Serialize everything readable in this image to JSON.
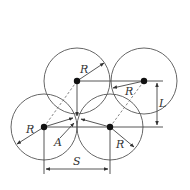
{
  "diagram": {
    "title": "",
    "labels": {
      "r_top_left": "R",
      "r_top_right": "R",
      "r_bottom_left": "R",
      "r_bottom_right": "R",
      "point_a": "A",
      "spacing_s": "S",
      "offset_l": "L"
    },
    "circles": [
      {
        "id": "top-left",
        "cx": 77,
        "cy": 81,
        "r": 33
      },
      {
        "id": "top-right",
        "cx": 144,
        "cy": 81,
        "r": 33
      },
      {
        "id": "bottom-left",
        "cx": 44,
        "cy": 127,
        "r": 33
      },
      {
        "id": "bottom-right",
        "cx": 110,
        "cy": 127,
        "r": 33
      }
    ],
    "colors": {
      "stroke": "#555555",
      "center_dot": "#111111",
      "background": "#ffffff"
    }
  }
}
